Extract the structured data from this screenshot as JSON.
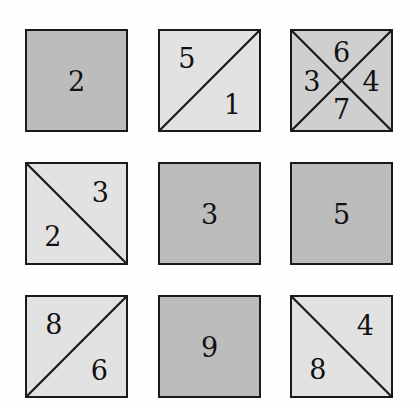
{
  "figure": {
    "type": "square-partition-grid",
    "rows": 3,
    "columns": 3,
    "background_color": "#fefefe",
    "border_color": "#1a1a1a",
    "text_color": "#111111",
    "fill_colors": {
      "solid": "#bcbcbc",
      "light": "#e2e2e2",
      "medium": "#cfcfcf"
    }
  },
  "cells": [
    {
      "id": "cell-r1c1",
      "row": 1,
      "column": 1,
      "fill": "fill-dark",
      "split": "none",
      "labels": [
        {
          "value": "2",
          "position": "pos-center",
          "region": "whole"
        }
      ]
    },
    {
      "id": "cell-r1c2",
      "row": 1,
      "column": 2,
      "fill": "fill-light",
      "split": "anti-diagonal",
      "labels": [
        {
          "value": "5",
          "position": "pos-upper-left",
          "region": "upper-left"
        },
        {
          "value": "1",
          "position": "pos-lower-right",
          "region": "lower-right"
        }
      ]
    },
    {
      "id": "cell-r1c3",
      "row": 1,
      "column": 3,
      "fill": "fill-medium",
      "split": "cross",
      "labels": [
        {
          "value": "6",
          "position": "pos-top",
          "region": "top"
        },
        {
          "value": "3",
          "position": "pos-left",
          "region": "left"
        },
        {
          "value": "4",
          "position": "pos-right",
          "region": "right"
        },
        {
          "value": "7",
          "position": "pos-bottom",
          "region": "bottom"
        }
      ]
    },
    {
      "id": "cell-r2c1",
      "row": 2,
      "column": 1,
      "fill": "fill-light",
      "split": "main-diagonal",
      "labels": [
        {
          "value": "3",
          "position": "pos-upper-right",
          "region": "upper-right"
        },
        {
          "value": "2",
          "position": "pos-lower-left",
          "region": "lower-left"
        }
      ]
    },
    {
      "id": "cell-r2c2",
      "row": 2,
      "column": 2,
      "fill": "fill-dark",
      "split": "none",
      "labels": [
        {
          "value": "3",
          "position": "pos-center",
          "region": "whole"
        }
      ]
    },
    {
      "id": "cell-r2c3",
      "row": 2,
      "column": 3,
      "fill": "fill-dark",
      "split": "none",
      "labels": [
        {
          "value": "5",
          "position": "pos-center",
          "region": "whole"
        }
      ]
    },
    {
      "id": "cell-r3c1",
      "row": 3,
      "column": 1,
      "fill": "fill-light",
      "split": "anti-diagonal",
      "labels": [
        {
          "value": "8",
          "position": "pos-upper-left",
          "region": "upper-left"
        },
        {
          "value": "6",
          "position": "pos-lower-right",
          "region": "lower-right"
        }
      ]
    },
    {
      "id": "cell-r3c2",
      "row": 3,
      "column": 2,
      "fill": "fill-dark",
      "split": "none",
      "labels": [
        {
          "value": "9",
          "position": "pos-center",
          "region": "whole"
        }
      ]
    },
    {
      "id": "cell-r3c3",
      "row": 3,
      "column": 3,
      "fill": "fill-light",
      "split": "main-diagonal",
      "labels": [
        {
          "value": "4",
          "position": "pos-upper-right",
          "region": "upper-right"
        },
        {
          "value": "8",
          "position": "pos-lower-left",
          "region": "lower-left"
        }
      ]
    }
  ]
}
